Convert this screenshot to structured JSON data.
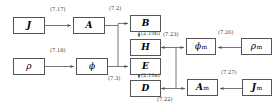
{
  "diagram": {
    "type": "block-flow-diagram",
    "title": "",
    "width": 278,
    "height": 111,
    "line_color": "#555555",
    "box_fill": "#ffffff",
    "text_color": "#000000",
    "nodes": [
      {
        "id": "J",
        "label": "J",
        "sub": "",
        "x": 13,
        "y": 17,
        "w": 32,
        "h": 17
      },
      {
        "id": "A",
        "label": "A",
        "sub": "",
        "x": 73,
        "y": 17,
        "w": 32,
        "h": 17
      },
      {
        "id": "B",
        "label": "B",
        "sub": "",
        "x": 130,
        "y": 15,
        "w": 31,
        "h": 17
      },
      {
        "id": "H",
        "label": "H",
        "sub": "",
        "x": 130,
        "y": 39,
        "w": 31,
        "h": 17
      },
      {
        "id": "rho",
        "label": "ρ",
        "sub": "",
        "x": 13,
        "y": 58,
        "w": 32,
        "h": 17
      },
      {
        "id": "phi",
        "label": "ϕ",
        "sub": "",
        "x": 76,
        "y": 58,
        "w": 32,
        "h": 17
      },
      {
        "id": "E",
        "label": "E",
        "sub": "",
        "x": 130,
        "y": 58,
        "w": 31,
        "h": 17
      },
      {
        "id": "D",
        "label": "D",
        "sub": "",
        "x": 130,
        "y": 80,
        "w": 31,
        "h": 17
      },
      {
        "id": "phi_m",
        "label": "ϕ",
        "sub": "m",
        "x": 186,
        "y": 38,
        "w": 30,
        "h": 17
      },
      {
        "id": "rho_m",
        "label": "ρ",
        "sub": "m",
        "x": 241,
        "y": 38,
        "w": 31,
        "h": 17
      },
      {
        "id": "A_m",
        "label": "A",
        "sub": "m",
        "x": 187,
        "y": 79,
        "w": 31,
        "h": 17
      },
      {
        "id": "J_m",
        "label": "J",
        "sub": "m",
        "x": 242,
        "y": 79,
        "w": 30,
        "h": 17
      }
    ],
    "edge_labels": [
      {
        "id": "eq_7_17",
        "text": "(7.17)",
        "x": 50,
        "y": 7,
        "from": "J",
        "to": "A"
      },
      {
        "id": "eq_7_2",
        "text": "(7.2)",
        "x": 109,
        "y": 7,
        "from": "A",
        "to": "B"
      },
      {
        "id": "eq_2_19b",
        "text": "(2.19b)",
        "x": 133,
        "y": 32,
        "from": "B",
        "to": "H"
      },
      {
        "id": "eq_7_23",
        "text": "(7.23)",
        "x": 160,
        "y": 33,
        "from": "H",
        "to": "phi_m"
      },
      {
        "id": "eq_7_26",
        "text": "(7.26)",
        "x": 216,
        "y": 30,
        "from": "rho_m",
        "to": "phi_m"
      },
      {
        "id": "eq_7_18",
        "text": "(7.18)",
        "x": 50,
        "y": 48,
        "from": "rho",
        "to": "phi"
      },
      {
        "id": "eq_7_3",
        "text": "(7.3)",
        "x": 108,
        "y": 77,
        "from": "phi",
        "to": "E"
      },
      {
        "id": "eq_2_19a",
        "text": "(2.19a)",
        "x": 133,
        "y": 73,
        "from": "E",
        "to": "D"
      },
      {
        "id": "eq_7_22",
        "text": "(7.22)",
        "x": 161,
        "y": 97,
        "from": "D",
        "to": "A_m"
      },
      {
        "id": "eq_7_27",
        "text": "(7.27)",
        "x": 219,
        "y": 70,
        "from": "J_m",
        "to": "A_m"
      }
    ]
  }
}
